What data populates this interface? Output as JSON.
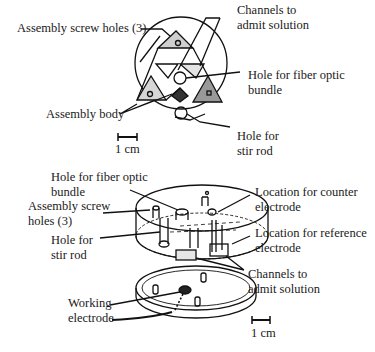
{
  "top_view": {
    "labels": {
      "screw_holes": "Assembly screw holes (3)",
      "channels_1": "Channels to",
      "channels_2": "admit solution",
      "fiber_1": "Hole for fiber optic",
      "fiber_2": "bundle",
      "body": "Assembly body",
      "stir_1": "Hole for",
      "stir_2": "stir rod"
    },
    "scale_label": "1 cm"
  },
  "exploded_view": {
    "labels": {
      "fiber_1": "Hole for fiber optic",
      "fiber_2": "bundle",
      "screw_1": "Assembly screw",
      "screw_2": "holes (3)",
      "stir_1": "Hole for",
      "stir_2": "stir rod",
      "counter_1": "Location for counter",
      "counter_2": "electrode",
      "reference_1": "Location for reference",
      "reference_2": "electrode",
      "channels_1": "Channels to",
      "channels_2": "admit solution",
      "working_1": "Working",
      "working_2": "electrode"
    },
    "scale_label": "1 cm"
  }
}
